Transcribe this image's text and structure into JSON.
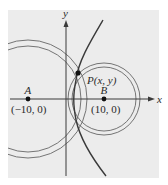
{
  "figure": {
    "type": "hyperbola-construction",
    "background_color": "#ececec",
    "axis_color": "#3a3a3a",
    "curve_color": "#3a3a3a",
    "circle_color": "#5a5a5a"
  },
  "axes": {
    "x_label": "x",
    "y_label": "y"
  },
  "points": {
    "A": {
      "label": "A",
      "coords_label": "(−10, 0)"
    },
    "B": {
      "label": "B",
      "coords_label": "(10, 0)"
    },
    "P": {
      "label": "P(x, y)"
    }
  }
}
